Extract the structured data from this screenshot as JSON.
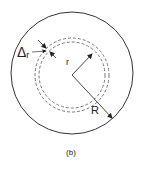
{
  "figure": {
    "caption": "(b)",
    "labels": {
      "delta_symbol": "Δ",
      "delta_subscript": "r",
      "inner_radius": "r",
      "outer_radius": "R"
    },
    "elements": [
      {
        "name": "outer-circle",
        "style": "solid"
      },
      {
        "name": "dashed-ring-outer",
        "style": "dashed"
      },
      {
        "name": "dashed-ring-inner",
        "style": "dashed"
      },
      {
        "name": "radius-r-arrow",
        "label": "r"
      },
      {
        "name": "radius-R-arrow",
        "label": "R"
      },
      {
        "name": "delta-r-thickness-arrows",
        "label": "Δr"
      }
    ],
    "colors": {
      "stroke": "#333333",
      "background": "#ffffff"
    }
  }
}
